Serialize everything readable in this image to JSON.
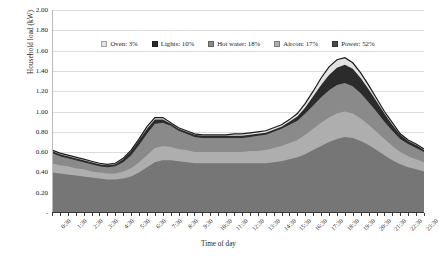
{
  "chart_data": {
    "type": "area",
    "stacked": true,
    "title": "",
    "xlabel": "Time of day",
    "ylabel": "Household load (kW)",
    "ylim": [
      0,
      2.0
    ],
    "ytick_step": 0.2,
    "ytick_labels": [
      "-",
      "0.20",
      "0.40",
      "0.60",
      "0.80",
      "1.00",
      "1.20",
      "1.40",
      "1.60",
      "1.80",
      "2.00"
    ],
    "ytick_values": [
      0,
      0.2,
      0.4,
      0.6,
      0.8,
      1.0,
      1.2,
      1.4,
      1.6,
      1.8,
      2.0
    ],
    "grid": true,
    "grid_axis": "y",
    "legend_position": "top-center",
    "x": [
      "0:30",
      "1:00",
      "1:30",
      "2:00",
      "2:30",
      "3:00",
      "3:30",
      "4:00",
      "4:30",
      "5:00",
      "5:30",
      "6:00",
      "6:30",
      "7:00",
      "7:30",
      "8:00",
      "8:30",
      "9:00",
      "9:30",
      "10:00",
      "10:30",
      "11:00",
      "11:30",
      "12:00",
      "12:30",
      "13:00",
      "13:30",
      "14:00",
      "14:30",
      "15:00",
      "15:30",
      "16:00",
      "16:30",
      "17:00",
      "17:30",
      "18:00",
      "18:30",
      "19:00",
      "19:30",
      "20:00",
      "20:30",
      "21:00",
      "21:30",
      "22:00",
      "22:30",
      "23:00",
      "23:30",
      "24:00"
    ],
    "xtick_labels": [
      "0:30",
      "1:30",
      "2:30",
      "3:30",
      "4:30",
      "5:30",
      "6:30",
      "7:30",
      "8:30",
      "9:30",
      "10:30",
      "11:30",
      "12:30",
      "13:30",
      "14:30",
      "15:30",
      "16:30",
      "17:30",
      "18:30",
      "19:30",
      "20:30",
      "21:30",
      "22:30",
      "23:30"
    ],
    "series": [
      {
        "name": "Power",
        "share_label": "Power: 52%",
        "share_pct": 52,
        "color": "#767676",
        "values": [
          0.4,
          0.39,
          0.38,
          0.37,
          0.36,
          0.35,
          0.34,
          0.33,
          0.33,
          0.34,
          0.36,
          0.4,
          0.45,
          0.5,
          0.52,
          0.52,
          0.51,
          0.5,
          0.49,
          0.49,
          0.49,
          0.49,
          0.49,
          0.49,
          0.49,
          0.49,
          0.49,
          0.49,
          0.5,
          0.51,
          0.53,
          0.55,
          0.58,
          0.62,
          0.66,
          0.7,
          0.73,
          0.75,
          0.74,
          0.71,
          0.67,
          0.62,
          0.57,
          0.52,
          0.48,
          0.45,
          0.43,
          0.41
        ]
      },
      {
        "name": "Aircon",
        "share_label": "Aircon: 17%",
        "share_pct": 17,
        "color": "#aeaeae",
        "values": [
          0.09,
          0.08,
          0.08,
          0.07,
          0.07,
          0.06,
          0.06,
          0.06,
          0.06,
          0.07,
          0.08,
          0.1,
          0.12,
          0.14,
          0.14,
          0.13,
          0.12,
          0.12,
          0.11,
          0.11,
          0.11,
          0.11,
          0.11,
          0.11,
          0.11,
          0.12,
          0.12,
          0.13,
          0.14,
          0.15,
          0.16,
          0.17,
          0.19,
          0.21,
          0.23,
          0.24,
          0.25,
          0.25,
          0.24,
          0.22,
          0.2,
          0.18,
          0.16,
          0.14,
          0.12,
          0.11,
          0.1,
          0.09
        ]
      },
      {
        "name": "Hot water",
        "share_label": "Hot water: 18%",
        "share_pct": 18,
        "color": "#8a8a8a",
        "values": [
          0.1,
          0.09,
          0.08,
          0.08,
          0.07,
          0.07,
          0.06,
          0.06,
          0.07,
          0.09,
          0.13,
          0.17,
          0.21,
          0.24,
          0.23,
          0.21,
          0.18,
          0.16,
          0.15,
          0.14,
          0.14,
          0.14,
          0.14,
          0.14,
          0.14,
          0.14,
          0.15,
          0.15,
          0.16,
          0.17,
          0.18,
          0.19,
          0.21,
          0.23,
          0.25,
          0.27,
          0.28,
          0.28,
          0.27,
          0.25,
          0.22,
          0.2,
          0.17,
          0.15,
          0.13,
          0.12,
          0.11,
          0.1
        ]
      },
      {
        "name": "Lights",
        "share_label": "Lights: 10%",
        "share_pct": 10,
        "color": "#2b2b2b",
        "values": [
          0.02,
          0.02,
          0.02,
          0.02,
          0.02,
          0.02,
          0.02,
          0.02,
          0.02,
          0.03,
          0.04,
          0.05,
          0.05,
          0.04,
          0.03,
          0.02,
          0.02,
          0.02,
          0.02,
          0.02,
          0.02,
          0.02,
          0.02,
          0.02,
          0.02,
          0.02,
          0.02,
          0.02,
          0.02,
          0.02,
          0.03,
          0.04,
          0.06,
          0.09,
          0.12,
          0.15,
          0.17,
          0.18,
          0.17,
          0.15,
          0.13,
          0.1,
          0.08,
          0.06,
          0.04,
          0.03,
          0.03,
          0.02
        ]
      },
      {
        "name": "Oven",
        "share_label": "Oven: 3%",
        "share_pct": 3,
        "color": "#e2e2e2",
        "values": [
          0.01,
          0.01,
          0.01,
          0.01,
          0.01,
          0.01,
          0.01,
          0.01,
          0.01,
          0.01,
          0.01,
          0.01,
          0.02,
          0.02,
          0.02,
          0.01,
          0.01,
          0.01,
          0.01,
          0.01,
          0.01,
          0.01,
          0.01,
          0.02,
          0.02,
          0.02,
          0.02,
          0.02,
          0.02,
          0.02,
          0.02,
          0.03,
          0.04,
          0.05,
          0.07,
          0.08,
          0.08,
          0.07,
          0.06,
          0.05,
          0.04,
          0.03,
          0.02,
          0.02,
          0.01,
          0.01,
          0.01,
          0.01
        ]
      }
    ],
    "totals_note": "Total peaks ~1.25 kW at 19:00-19:30; morning peak ~0.92 kW at 07:00; overnight minimum ~0.49 kW at 04:00"
  },
  "legend": {
    "items": [
      {
        "label": "Oven: 3%",
        "color": "#e2e2e2"
      },
      {
        "label": "Lights: 10%",
        "color": "#2b2b2b"
      },
      {
        "label": "Hot water: 18%",
        "color": "#8a8a8a"
      },
      {
        "label": "Aircon: 17%",
        "color": "#aeaeae"
      },
      {
        "label": "Power: 52%",
        "color": "#4a4a4a"
      }
    ]
  }
}
